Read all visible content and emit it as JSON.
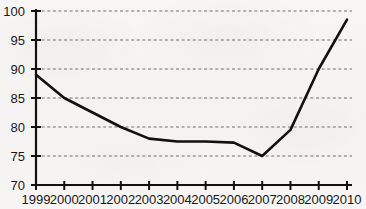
{
  "chart_data": {
    "type": "line",
    "title": "",
    "subtitle": "",
    "xlabel": "",
    "ylabel": "",
    "x": [
      1999,
      2000,
      2001,
      2002,
      2003,
      2004,
      2005,
      2006,
      2007,
      2008,
      2009,
      2010
    ],
    "categories": [
      "1999",
      "2000",
      "2001",
      "2002",
      "2003",
      "2004",
      "2005",
      "2006",
      "2007",
      "2008",
      "2009",
      "2010"
    ],
    "values": [
      89,
      85,
      82.5,
      80,
      78,
      77.5,
      77.5,
      77.3,
      75,
      79.5,
      90,
      98.5
    ],
    "series": [
      {
        "name": "series-1",
        "values": [
          89,
          85,
          82.5,
          80,
          78,
          77.5,
          77.5,
          77.3,
          75,
          79.5,
          90,
          98.5
        ],
        "color": "#111111"
      }
    ],
    "xlim": [
      1999,
      2010
    ],
    "ylim": [
      70,
      100
    ],
    "yticks": [
      70,
      75,
      80,
      85,
      90,
      95,
      100
    ],
    "ytick_labels": [
      "70",
      "75",
      "80",
      "85",
      "90",
      "95",
      "100"
    ],
    "xticks": [
      1999,
      2000,
      2001,
      2002,
      2003,
      2004,
      2005,
      2006,
      2007,
      2008,
      2009,
      2010
    ],
    "xtick_labels": [
      "1999",
      "2000",
      "2001",
      "2002",
      "2003",
      "2004",
      "2005",
      "2006",
      "2007",
      "2008",
      "2009",
      "2010"
    ],
    "grid": true,
    "grid_axis": "y",
    "grid_style": "dotted",
    "grid_color": "#9a9a9a",
    "legend": false,
    "legend_position": "none",
    "annotations": [],
    "colors": {
      "background": "#f6f5f3",
      "line": "#111111",
      "axis": "#111111",
      "text": "#17171a",
      "grid": "#9a9a9a"
    }
  }
}
